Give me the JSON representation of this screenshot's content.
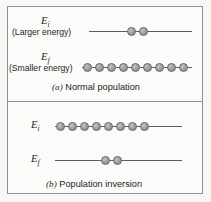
{
  "figure": {
    "background_color": "#f7f7f5",
    "frame_color": "#8f9295",
    "line_color": "#5a5f63",
    "dot_color": "#9a9a9a"
  },
  "panels": [
    {
      "id": "a",
      "caption_tag": "(a)",
      "caption_text": "Normal population",
      "levels": [
        {
          "id": "Ei",
          "symbol": "E",
          "subscript": "i",
          "note": "(Larger energy)",
          "dot_count": 2
        },
        {
          "id": "Ef",
          "symbol": "E",
          "subscript": "f",
          "note": "(Smaller energy)",
          "dot_count": 9
        }
      ]
    },
    {
      "id": "b",
      "caption_tag": "(b)",
      "caption_text": "Population inversion",
      "levels": [
        {
          "id": "Ei",
          "symbol": "E",
          "subscript": "i",
          "note": "",
          "dot_count": 8
        },
        {
          "id": "Ef",
          "symbol": "E",
          "subscript": "f",
          "note": "",
          "dot_count": 2
        }
      ]
    }
  ]
}
